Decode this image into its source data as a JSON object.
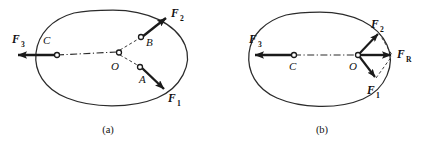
{
  "figure": {
    "type": "physics-force-diagram",
    "background_color": "#ffffff",
    "line_color": "#1a1a1a",
    "panels": [
      {
        "id": "panel-a",
        "caption": "(a)",
        "points": [
          {
            "label": "C",
            "name": "point-c"
          },
          {
            "label": "O",
            "name": "point-o"
          },
          {
            "label": "A",
            "name": "point-a"
          },
          {
            "label": "B",
            "name": "point-b"
          }
        ],
        "vectors": [
          {
            "label": "F",
            "subscript": "3",
            "name": "force-f3",
            "direction": "left",
            "origin_point": "C"
          },
          {
            "label": "F",
            "subscript": "2",
            "name": "force-f2",
            "direction": "up-right",
            "origin_point": "B"
          },
          {
            "label": "F",
            "subscript": "1",
            "name": "force-f1",
            "direction": "down-right",
            "origin_point": "A"
          }
        ]
      },
      {
        "id": "panel-b",
        "caption": "(b)",
        "points": [
          {
            "label": "C",
            "name": "point-c"
          },
          {
            "label": "O",
            "name": "point-o"
          }
        ],
        "vectors": [
          {
            "label": "F",
            "subscript": "3",
            "name": "force-f3",
            "direction": "left",
            "origin_point": "C"
          },
          {
            "label": "F",
            "subscript": "2",
            "name": "force-f2",
            "direction": "up-right",
            "origin_point": "O"
          },
          {
            "label": "F",
            "subscript": "1",
            "name": "force-f1",
            "direction": "down-right",
            "origin_point": "O"
          },
          {
            "label": "F",
            "subscript": "R",
            "name": "force-fr-resultant",
            "direction": "right",
            "origin_point": "O"
          }
        ]
      }
    ]
  },
  "labels": {
    "f_symbol": "F",
    "sub_1": "1",
    "sub_2": "2",
    "sub_3": "3",
    "sub_R": "R",
    "point_a": "A",
    "point_b": "B",
    "point_c": "C",
    "point_o": "O",
    "caption_a": "(a)",
    "caption_b": "(b)"
  }
}
